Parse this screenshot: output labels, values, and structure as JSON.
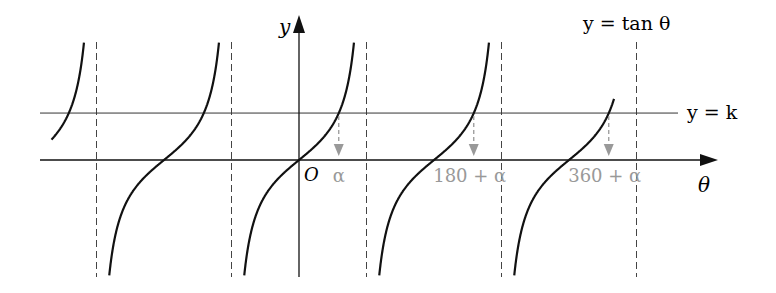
{
  "chart_data": {
    "type": "line",
    "title": "",
    "function_label": "y = tan θ",
    "xlabel": "θ",
    "ylabel": "y",
    "origin_label": "O",
    "horizontal_line": {
      "label": "y = k",
      "k": 1.33
    },
    "series": [
      {
        "name": "y = tan θ",
        "function": "tan",
        "period_deg": 180,
        "domain_deg": [
          -330,
          420
        ]
      }
    ],
    "asymptotes_deg": [
      -270,
      -90,
      90,
      270,
      450
    ],
    "solution_markers": [
      {
        "label": "α",
        "theta_deg": 53
      },
      {
        "label": "180 + α",
        "theta_deg": 233
      },
      {
        "label": "360 + α",
        "theta_deg": 413
      }
    ],
    "xlim_deg": [
      -340,
      470
    ],
    "ylim": [
      -3.3,
      3.35
    ],
    "grid": false,
    "colors": {
      "curve": "#111111",
      "axis": "#111111",
      "asymptote": "#444444",
      "marker": "#999999",
      "k_line": "#333333"
    }
  },
  "layout": {
    "origin_px": [
      299,
      160
    ],
    "px_per_deg": 0.75,
    "px_per_unit": 35.3,
    "y_top_px": 42,
    "y_bottom_px": 277
  }
}
